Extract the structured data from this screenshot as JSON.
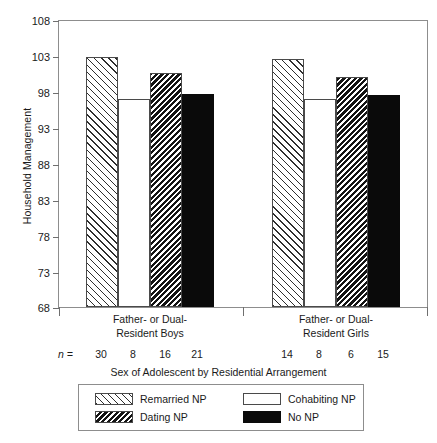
{
  "chart_data": {
    "type": "bar",
    "title": "",
    "xlabel": "Sex of Adolescent by Residential Arrangement",
    "ylabel": "Household Management",
    "ylim": [
      68,
      108
    ],
    "yticks": [
      68,
      73,
      78,
      83,
      88,
      93,
      98,
      103,
      108
    ],
    "grid": false,
    "legend_position": "below-plot",
    "categories": [
      "Father- or Dual-Resident Boys",
      "Father- or Dual-Resident Girls"
    ],
    "category_lines": [
      [
        "Father- or Dual-",
        "Resident Boys"
      ],
      [
        "Father- or Dual-",
        "Resident Girls"
      ]
    ],
    "series": [
      {
        "name": "Remarried NP",
        "pattern": "forward-diagonal-hatch",
        "values": [
          102.7,
          102.5
        ],
        "n": [
          30,
          14
        ]
      },
      {
        "name": "Cohabiting NP",
        "pattern": "white-empty",
        "values": [
          96.9,
          96.9
        ],
        "n": [
          8,
          8
        ]
      },
      {
        "name": "Dating NP",
        "pattern": "dense-back-diagonal-hatch",
        "values": [
          100.5,
          99.9
        ],
        "n": [
          16,
          6
        ]
      },
      {
        "name": "No NP",
        "pattern": "solid-black",
        "values": [
          97.6,
          97.4
        ],
        "n": [
          21,
          15
        ]
      }
    ],
    "n_row_label": "n =",
    "n_values": [
      30,
      8,
      16,
      21,
      14,
      8,
      6,
      15
    ],
    "colors": {
      "axis": "#8d8d8d",
      "tick": "#6f6f6f",
      "bar_outline": "#4a4a4a",
      "solid_black": "#0a0a0a",
      "background": "#ffffff",
      "text": "#1a1a1a"
    }
  },
  "legend": {
    "items": [
      {
        "label": "Remarried NP",
        "swatch": "remarried"
      },
      {
        "label": "Cohabiting NP",
        "swatch": "cohabiting"
      },
      {
        "label": "Dating NP",
        "swatch": "dating"
      },
      {
        "label": "No NP",
        "swatch": "nonp"
      }
    ]
  },
  "axis": {
    "y_title": "Household Management",
    "x_title": "Sex of Adolescent by Residential Arrangement",
    "y_tick_labels": [
      "108",
      "103",
      "98",
      "93",
      "88",
      "83",
      "78",
      "73",
      "68"
    ]
  }
}
